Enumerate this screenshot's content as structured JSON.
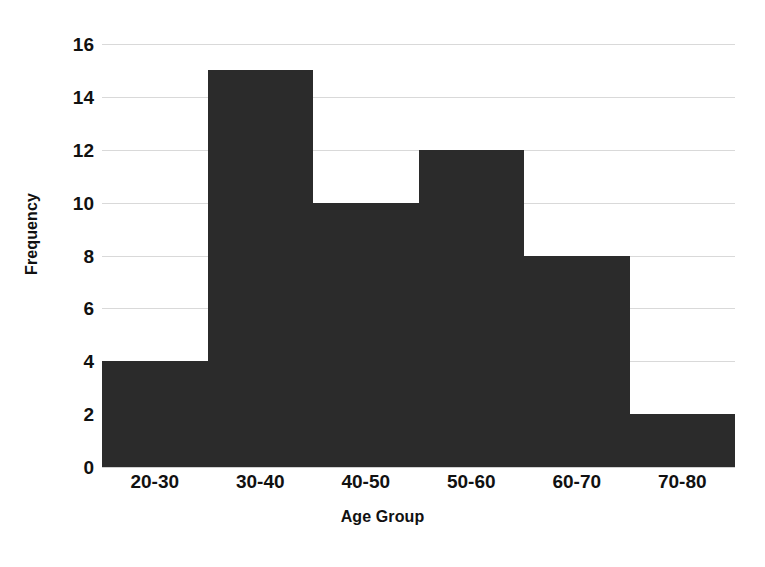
{
  "chart_data": {
    "type": "bar",
    "title": "",
    "subtitle": "",
    "xlabel": "Age Group",
    "ylabel": "Frequency",
    "categories": [
      "20-30",
      "30-40",
      "40-50",
      "50-60",
      "60-70",
      "70-80"
    ],
    "values": [
      4,
      15,
      10,
      12,
      8,
      2
    ],
    "series": [
      {
        "name": "Frequency",
        "values": [
          4,
          15,
          10,
          12,
          8,
          2
        ]
      }
    ],
    "ylim": [
      0,
      16
    ],
    "xlim": [
      0,
      6
    ],
    "y_ticks": [
      0,
      2,
      4,
      6,
      8,
      10,
      12,
      14,
      16
    ],
    "y_tick_labels": [
      "0",
      "2",
      "4",
      "6",
      "8",
      "10",
      "12",
      "14",
      "16"
    ],
    "x_tick_labels": [
      "20-30",
      "30-40",
      "40-50",
      "50-60",
      "60-70",
      "70-80"
    ],
    "grid": "horizontal",
    "legend": "none",
    "bar_gap": 0,
    "annotations": [],
    "colors": {
      "bar_fill": "#2b2b2b",
      "gridline": "#d9d9d9",
      "background": "#ffffff",
      "text": "#111111"
    }
  }
}
